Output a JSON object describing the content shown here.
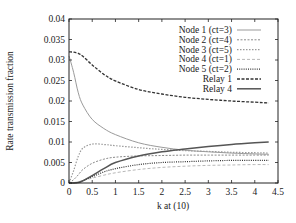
{
  "chart_data": {
    "type": "line",
    "title": "",
    "xlabel": "k at (10)",
    "ylabel": "Rate transmission fraction",
    "xlim": [
      0,
      4.5
    ],
    "ylim": [
      0,
      0.04
    ],
    "xticks": [
      "0",
      "0.5",
      "1",
      "1.5",
      "2",
      "2.5",
      "3",
      "3.5",
      "4",
      "4.5"
    ],
    "yticks": [
      "0",
      "0.005",
      "0.01",
      "0.015",
      "0.02",
      "0.025",
      "0.03",
      "0.035",
      "0.04"
    ],
    "grid": false,
    "legend_position": "upper right",
    "x": [
      0,
      0.1,
      0.2,
      0.3,
      0.5,
      0.75,
      1.0,
      1.5,
      2.0,
      2.5,
      3.0,
      3.5,
      4.0,
      4.3
    ],
    "series": [
      {
        "name": "Node 1 (ct=3)",
        "color": "#9a9a9a",
        "dash": "",
        "width": 1,
        "values": [
          0.031,
          0.027,
          0.022,
          0.019,
          0.0155,
          0.0133,
          0.0118,
          0.0098,
          0.0087,
          0.008,
          0.0076,
          0.0073,
          0.0071,
          0.007
        ]
      },
      {
        "name": "Node 2 (ct=4)",
        "color": "#8a8a8a",
        "dash": "2,1.5",
        "width": 1,
        "values": [
          0,
          0.0008,
          0.002,
          0.0033,
          0.0048,
          0.0058,
          0.0063,
          0.0066,
          0.0067,
          0.0068,
          0.0068,
          0.0068,
          0.0068,
          0.0068
        ]
      },
      {
        "name": "Node 3 (ct=5)",
        "color": "#9a9a9a",
        "dash": "1.5,1.5",
        "width": 1.2,
        "values": [
          0,
          0.003,
          0.0065,
          0.0085,
          0.0095,
          0.0094,
          0.0091,
          0.0086,
          0.0082,
          0.0079,
          0.0077,
          0.0075,
          0.0074,
          0.0073
        ]
      },
      {
        "name": "Node 4 (ct=1)",
        "color": "#b8b8b8",
        "dash": "3,2",
        "width": 1,
        "values": [
          0,
          0.0001,
          0.0003,
          0.0006,
          0.0012,
          0.0019,
          0.0025,
          0.0033,
          0.0038,
          0.0041,
          0.0043,
          0.0044,
          0.0045,
          0.0045
        ]
      },
      {
        "name": "Node 5 (ct=2)",
        "color": "#333333",
        "dash": "1,1.2",
        "width": 1.2,
        "values": [
          0,
          0,
          0.0002,
          0.0006,
          0.0015,
          0.0027,
          0.0035,
          0.0045,
          0.005,
          0.0052,
          0.0054,
          0.0055,
          0.0055,
          0.0055
        ]
      },
      {
        "name": "Relay 1",
        "color": "#333333",
        "dash": "3,1.5",
        "width": 1.3,
        "values": [
          0.032,
          0.0319,
          0.0316,
          0.0309,
          0.0288,
          0.0265,
          0.0249,
          0.0228,
          0.0217,
          0.0209,
          0.0204,
          0.02,
          0.0197,
          0.0195
        ]
      },
      {
        "name": "Relay 4",
        "color": "#555555",
        "dash": "",
        "width": 1.5,
        "values": [
          0,
          0,
          0.0001,
          0.0005,
          0.0018,
          0.0035,
          0.005,
          0.0066,
          0.0076,
          0.0083,
          0.0089,
          0.0094,
          0.0098,
          0.01
        ]
      }
    ]
  }
}
